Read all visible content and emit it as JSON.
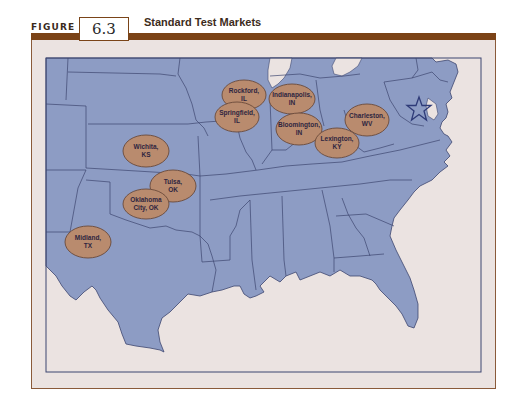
{
  "figure": {
    "label": "FIGURE",
    "number": "6.3",
    "title": "Standard Test Markets"
  },
  "colors": {
    "title_bar": "#7b4317",
    "frame_background": "#ebe3e1",
    "land": "#8d9cc4",
    "state_border": "#3d4670",
    "market_oval": "#b98b6e",
    "market_oval_border": "#6a4a3a",
    "label_text": "#2e2540",
    "star": "#2f3b78"
  },
  "markets": [
    {
      "city": "Rockford,",
      "state": "IL",
      "cx": 244,
      "cy": 95
    },
    {
      "city": "Springfield,",
      "state": "IL",
      "cx": 237,
      "cy": 117
    },
    {
      "city": "Indianapolis,",
      "state": "IN",
      "cx": 292,
      "cy": 99
    },
    {
      "city": "Bloomington,",
      "state": "IN",
      "cx": 299,
      "cy": 129
    },
    {
      "city": "Charleston,",
      "state": "WV",
      "cx": 367,
      "cy": 120
    },
    {
      "city": "Lexington,",
      "state": "KY",
      "cx": 337,
      "cy": 143
    },
    {
      "city": "Wichita,",
      "state": "KS",
      "cx": 146,
      "cy": 151
    },
    {
      "city": "Tulsa,",
      "state": "OK",
      "cx": 173,
      "cy": 186
    },
    {
      "city": "Oklahoma",
      "state": "City, OK",
      "cx": 146,
      "cy": 204
    },
    {
      "city": "Midland,",
      "state": "TX",
      "cx": 88,
      "cy": 242
    }
  ],
  "markers": [
    {
      "type": "star",
      "meaning": "star-marker",
      "cx": 419,
      "cy": 109
    }
  ]
}
